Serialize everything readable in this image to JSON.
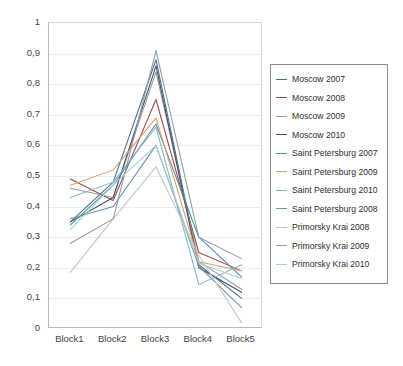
{
  "chart_data": {
    "type": "line",
    "title": "",
    "xlabel": "",
    "ylabel": "",
    "ylim": [
      0,
      1
    ],
    "grid": true,
    "legend_position": "right",
    "categories": [
      "Block1",
      "Block2",
      "Block3",
      "Block4",
      "Block5"
    ],
    "ytick_labels": [
      "0",
      "0,1",
      "0,2",
      "0,3",
      "0,4",
      "0,5",
      "0,6",
      "0,7",
      "0,8",
      "0,9",
      "1"
    ],
    "ytick_values": [
      0,
      0.1,
      0.2,
      0.3,
      0.4,
      0.5,
      0.6,
      0.7,
      0.8,
      0.9,
      1
    ],
    "series": [
      {
        "name": "Moscow 2007",
        "color": "#4a6b8a",
        "values": [
          0.35,
          0.48,
          0.88,
          0.21,
          0.1
        ]
      },
      {
        "name": "Moscow 2008",
        "color": "#9c4a47",
        "values": [
          0.49,
          0.42,
          0.75,
          0.25,
          0.19
        ]
      },
      {
        "name": "Moscow 2009",
        "color": "#9b9b9b",
        "values": [
          0.46,
          0.43,
          0.84,
          0.22,
          0.13
        ]
      },
      {
        "name": "Moscow 2010",
        "color": "#3f4e5c",
        "values": [
          0.35,
          0.43,
          0.86,
          0.2,
          0.12
        ]
      },
      {
        "name": "Saint Petersburg 2007",
        "color": "#4d8fa6",
        "values": [
          0.34,
          0.47,
          0.67,
          0.3,
          0.17
        ]
      },
      {
        "name": "Saint Petersburg 2009",
        "color": "#d8a06a",
        "values": [
          0.47,
          0.52,
          0.69,
          0.22,
          0.19
        ]
      },
      {
        "name": "Saint Petersburg 2010",
        "color": "#7fb4cf",
        "values": [
          0.43,
          0.48,
          0.66,
          0.145,
          0.21
        ]
      },
      {
        "name": "Saint Petersburg 2008",
        "color": "#6f93ad",
        "values": [
          0.36,
          0.4,
          0.6,
          0.205,
          0.07
        ]
      },
      {
        "name": "Primorsky Krai 2008",
        "color": "#c4c4c4",
        "values": [
          0.185,
          0.36,
          0.53,
          0.24,
          0.02
        ]
      },
      {
        "name": "Primorsky Krai 2009",
        "color": "#8d9aa3",
        "values": [
          0.28,
          0.36,
          0.91,
          0.3,
          0.23
        ]
      },
      {
        "name": "Primorsky Krai 2010",
        "color": "#a8cfd4",
        "values": [
          0.325,
          0.47,
          0.6,
          0.215,
          0.165
        ]
      }
    ]
  },
  "legend": {
    "items": [
      "Moscow 2007",
      "Moscow 2008",
      "Moscow 2009",
      "Moscow 2010",
      "Saint Petersburg 2007",
      "Saint Petersburg 2009",
      "Saint Petersburg 2010",
      "Saint Petersburg 2008",
      "Primorsky Krai 2008",
      "Primorsky Krai 2009",
      "Primorsky Krai 2010"
    ]
  }
}
